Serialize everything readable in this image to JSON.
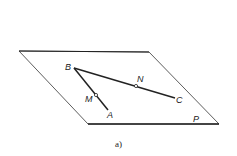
{
  "figure": {
    "caption": "a)",
    "plane_label": "P",
    "points": {
      "A": "A",
      "B": "B",
      "C": "C",
      "M": "M",
      "N": "N"
    },
    "colors": {
      "line": "#222222",
      "background": "#ffffff"
    }
  }
}
